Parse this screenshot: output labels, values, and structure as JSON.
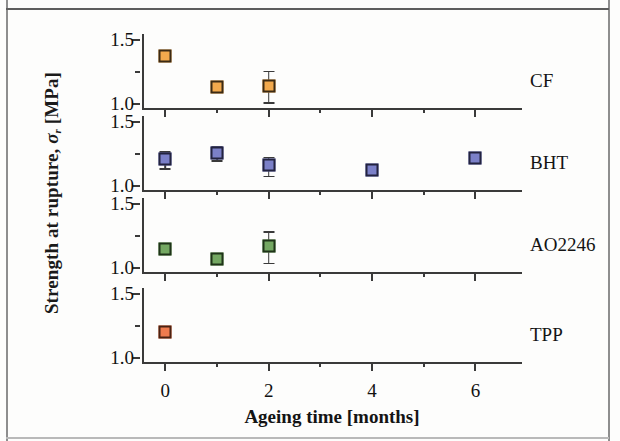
{
  "chart_data": {
    "type": "scatter",
    "title": "",
    "xlabel": "Ageing time [months]",
    "ylabel": "Strength at rupture, σr [MPa]",
    "ylabel_parts": {
      "main": "Strength at rupture,",
      "symbol": "σ",
      "subscript": "r",
      "units": "[MPa]"
    },
    "xlim": [
      -0.45,
      6.9
    ],
    "xticks": [
      0,
      1,
      2,
      3,
      4,
      5,
      6
    ],
    "xticklabels": [
      "0",
      "",
      "2",
      "",
      "4",
      "",
      "6"
    ],
    "x_major_ticks": [
      0,
      2,
      4,
      6
    ],
    "x_minor_ticks": [
      1,
      3,
      5
    ],
    "ylim": [
      0.95,
      1.55
    ],
    "yticks": [
      1.0,
      1.25,
      1.5
    ],
    "yticklabels": [
      "1.0",
      "",
      "1.5"
    ],
    "y_major_ticks": [
      1.0,
      1.5
    ],
    "y_minor_ticks": [
      1.25
    ],
    "grid": false,
    "legend_position": "right-of-panel",
    "panels": [
      {
        "name": "CF",
        "label": "CF",
        "color": "#f2a94d",
        "edge_color": "#3b2a14",
        "x": [
          0,
          1,
          2
        ],
        "values": [
          1.38,
          1.13,
          1.14
        ],
        "err_low": [
          0.03,
          0.03,
          0.13
        ],
        "err_high": [
          0.03,
          0.02,
          0.12
        ]
      },
      {
        "name": "BHT",
        "label": "BHT",
        "color": "#7b80c8",
        "edge_color": "#23233f",
        "x": [
          0,
          1,
          2,
          4,
          6
        ],
        "values": [
          1.21,
          1.26,
          1.16,
          1.12,
          1.22
        ],
        "err_low": [
          0.07,
          0.06,
          0.08,
          0.0,
          0.0
        ],
        "err_high": [
          0.06,
          0.05,
          0.07,
          0.0,
          0.0
        ]
      },
      {
        "name": "AO2246",
        "label": "AO2246",
        "color": "#74a862",
        "edge_color": "#1f3319",
        "x": [
          0,
          1,
          2
        ],
        "values": [
          1.15,
          1.07,
          1.17
        ],
        "err_low": [
          0.04,
          0.04,
          0.13
        ],
        "err_high": [
          0.03,
          0.03,
          0.12
        ]
      },
      {
        "name": "TPP",
        "label": "TPP",
        "color": "#ef7b4e",
        "edge_color": "#4a2212",
        "x": [
          0
        ],
        "values": [
          1.2
        ],
        "err_low": [
          0.02
        ],
        "err_high": [
          0.02
        ]
      }
    ]
  }
}
